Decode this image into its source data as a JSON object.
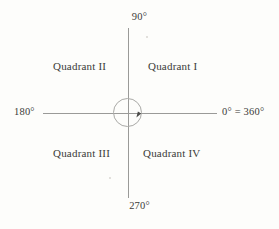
{
  "figure": {
    "type": "coordinate-plane-quadrants",
    "background_color": "#fdfdfb",
    "line_color": "#9a9a98",
    "text_color": "#3b3b39"
  },
  "axes": {
    "horizontal_name": "horizontal-axis",
    "vertical_name": "vertical-axis"
  },
  "origin": {
    "circle_name": "origin-circle",
    "arrow_name": "counterclockwise-direction-arrow"
  },
  "angle_labels": {
    "top": "90°",
    "bottom": "270°",
    "left": "180°",
    "right": "0° = 360°"
  },
  "quadrants": [
    {
      "id": "quadrant-1",
      "label": "Quadrant I"
    },
    {
      "id": "quadrant-2",
      "label": "Quadrant II"
    },
    {
      "id": "quadrant-3",
      "label": "Quadrant III"
    },
    {
      "id": "quadrant-4",
      "label": "Quadrant IV"
    }
  ],
  "chart_data": {
    "type": "scatter",
    "xlabel": "",
    "ylabel": "",
    "xlim": [
      -1,
      1
    ],
    "ylim": [
      -1,
      1
    ],
    "grid": false,
    "legend": "none",
    "angle_ticks": [
      {
        "angle": 0,
        "label": "0° = 360°",
        "position": "right"
      },
      {
        "angle": 90,
        "label": "90°",
        "position": "top"
      },
      {
        "angle": 180,
        "label": "180°",
        "position": "left"
      },
      {
        "angle": 270,
        "label": "270°",
        "position": "bottom"
      }
    ],
    "annotations": [
      {
        "text": "Quadrant I",
        "angle_range": [
          0,
          90
        ],
        "position": "upper-right"
      },
      {
        "text": "Quadrant II",
        "angle_range": [
          90,
          180
        ],
        "position": "upper-left"
      },
      {
        "text": "Quadrant III",
        "angle_range": [
          180,
          270
        ],
        "position": "lower-left"
      },
      {
        "text": "Quadrant IV",
        "angle_range": [
          270,
          360
        ],
        "position": "lower-right"
      }
    ]
  }
}
